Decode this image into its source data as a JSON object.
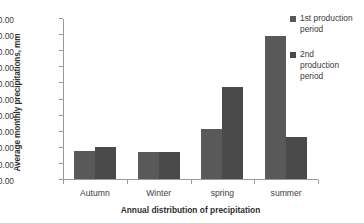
{
  "chart_data": {
    "type": "bar",
    "title": "",
    "xlabel": "Annual distribution of precipitation",
    "ylabel": "Average monthly precipitations, mm",
    "categories": [
      "Autumn",
      "Winter",
      "spring",
      "summer"
    ],
    "series": [
      {
        "name": "1st production period",
        "color": "#595959",
        "values": [
          37.5,
          36.5,
          51.0,
          109.0
        ]
      },
      {
        "name": "2nd production period",
        "color": "#4a4a4a",
        "values": [
          40.0,
          36.5,
          77.0,
          46.0
        ]
      }
    ],
    "ylim": [
      20.0,
      120.0
    ],
    "ytick_step": 10.0,
    "yticks": [
      20.0,
      30.0,
      40.0,
      50.0,
      60.0,
      70.0,
      80.0,
      90.0,
      100.0,
      110.0,
      120.0
    ],
    "ytick_labels": [
      "20.00",
      "30.00",
      "40.00",
      "50.00",
      "60.00",
      "70.00",
      "80.00",
      "90.00",
      "100.00",
      "110.00",
      "120.00"
    ],
    "grid": false,
    "legend_position": "right",
    "legend": [
      {
        "label_lines": [
          "1st production",
          "period"
        ],
        "color": "#595959"
      },
      {
        "label_lines": [
          "2nd",
          "production",
          "period"
        ],
        "color": "#4a4a4a"
      }
    ]
  },
  "legend": {
    "entry1_line1": "1st production",
    "entry1_line2": "period",
    "entry2_line1": "2nd",
    "entry2_line2": "production",
    "entry2_line3": "period"
  },
  "axis": {
    "y_title": "Average monthly precipitations, mm",
    "x_title": "Annual distribution of precipitation"
  }
}
